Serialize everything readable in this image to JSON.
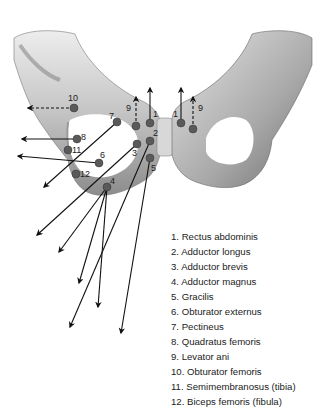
{
  "figure": {
    "type": "anatomical diagram",
    "colors": {
      "bone": "#c9c9c9",
      "bone_shadow": "#8a8a8a",
      "marker": "#555555",
      "arrow": "#111111"
    }
  },
  "markers": [
    {
      "n": "1",
      "label": "1"
    },
    {
      "n": "2",
      "label": "2"
    },
    {
      "n": "3",
      "label": "3"
    },
    {
      "n": "4",
      "label": "4"
    },
    {
      "n": "5",
      "label": "5"
    },
    {
      "n": "6",
      "label": "6"
    },
    {
      "n": "7",
      "label": "7"
    },
    {
      "n": "8",
      "label": "8"
    },
    {
      "n": "9",
      "label": "9"
    },
    {
      "n": "10",
      "label": "10"
    },
    {
      "n": "11",
      "label": "11"
    },
    {
      "n": "12",
      "label": "12"
    }
  ],
  "legend": [
    "1. Rectus abdominis",
    "2. Adductor longus",
    "3. Adductor brevis",
    "4. Adductor magnus",
    "5. Gracilis",
    "6. Obturator externus",
    "7. Pectineus",
    "8. Quadratus femoris",
    "9. Levator ani",
    "10. Obturator femoris",
    "11. Semimembranosus (tibia)",
    "12. Biceps femoris (fibula)"
  ]
}
